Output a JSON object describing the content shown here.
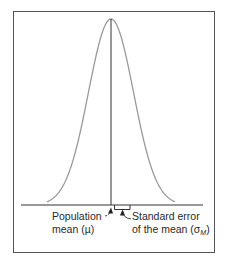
{
  "figure": {
    "type": "normal-distribution-diagram",
    "frame_color": "#555555",
    "curve_color": "#9a9a9a",
    "line_color": "#333333"
  },
  "labels": {
    "population_mean": {
      "line1": "Population",
      "line2": "mean (µ)"
    },
    "standard_error": {
      "line1": "Standard error",
      "line2_prefix": "of the mean (σ",
      "subscript": "M",
      "line2_suffix": ")"
    }
  }
}
